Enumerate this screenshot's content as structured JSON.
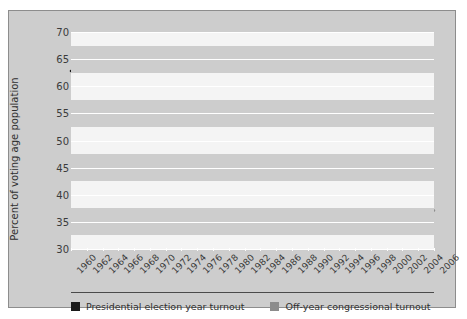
{
  "chart_data": {
    "type": "line",
    "title": "",
    "xlabel": "",
    "ylabel": "Percent of voting age population",
    "ylim": [
      30,
      70
    ],
    "yticks": [
      30,
      35,
      40,
      45,
      50,
      55,
      60,
      65,
      70
    ],
    "grid": true,
    "legend_position": "bottom",
    "x": [
      1960,
      1962,
      1964,
      1966,
      1968,
      1970,
      1972,
      1974,
      1976,
      1978,
      1980,
      1982,
      1984,
      1986,
      1988,
      1990,
      1992,
      1994,
      1996,
      1998,
      2000,
      2002,
      2004,
      2006
    ],
    "series": [
      {
        "name": "Presidential election year turnout",
        "color": "#1a1a1a",
        "x": [
          1960,
          1964,
          1968,
          1972,
          1976,
          1980,
          1984,
          1988,
          1992,
          1996,
          2000,
          2004
        ],
        "values": [
          62.8,
          61.9,
          60.9,
          55.2,
          53.5,
          52.8,
          53.3,
          50.3,
          55.2,
          49.1,
          51.3,
          56.7
        ]
      },
      {
        "name": "Off-year congressional turnout",
        "color": "#8c8c8c",
        "x": [
          1962,
          1966,
          1970,
          1974,
          1978,
          1982,
          1986,
          1990,
          1994,
          1998,
          2002,
          2006
        ],
        "values": [
          45.4,
          45.4,
          43.5,
          35.9,
          34.9,
          38.0,
          36.4,
          36.5,
          38.8,
          36.0,
          37.0,
          37.1
        ]
      }
    ],
    "legend": [
      {
        "label": "Presidential election year turnout",
        "color": "#1a1a1a"
      },
      {
        "label": "Off-year congressional turnout",
        "color": "#8c8c8c"
      }
    ],
    "colors": {
      "panel_background": "#cdcdcd",
      "band_light": "#f4f4f4",
      "band_dark": "#cdcdcd",
      "frame_border": "#8d8d8d",
      "axis_text": "#3b3b3b"
    }
  }
}
